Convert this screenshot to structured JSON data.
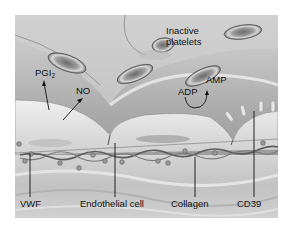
{
  "figure": {
    "type": "illustration",
    "labels": {
      "inactive_platelets": "Inactive platelets",
      "inactive_platelets_line1": "Inactive",
      "inactive_platelets_line2": "platelets",
      "pgi2_base": "PGI",
      "pgi2_sub": "2",
      "no": "NO",
      "adp": "ADP",
      "amp": "AMP",
      "vwf": "VWF",
      "endothelial_cell": "Endothelial cell",
      "collagen": "Collagen",
      "cd39": "CD39"
    },
    "colors": {
      "lumen": "#9a9a9a",
      "endothelium": "#d8d8d8",
      "subendothelium": "#c9c9c9",
      "platelet": "#8a8a8a",
      "text": "#111111"
    }
  }
}
